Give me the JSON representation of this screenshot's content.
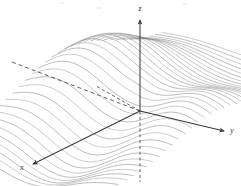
{
  "figure": {
    "title": "",
    "caption": "",
    "kind": "3d-surface-wireframe",
    "background_color": "#ffffff"
  },
  "axes": {
    "x": {
      "label": "x",
      "label_x": 22,
      "label_y": 170,
      "color": "#3a3a3a"
    },
    "y": {
      "label": "y",
      "label_x": 231,
      "label_y": 131,
      "color": "#3a3a3a"
    },
    "z": {
      "label": "z",
      "label_x": 140,
      "label_y": 9,
      "color": "#3a3a3a"
    }
  },
  "surface": {
    "mesh_color": "#8c8c8c",
    "mesh_color_dark": "#6e6e6e",
    "trace_count": 34,
    "style": "u-parameter traces"
  },
  "chart_data": {
    "type": "line",
    "title": "",
    "subtitle": "",
    "xlabel": "x",
    "ylabel": "y",
    "zlabel": "z",
    "projection": "3d-oblique",
    "origin_px": [
      140,
      111
    ],
    "grid": false,
    "legend": null,
    "axis_endpoints_px": {
      "x_negative": [
        12,
        62
      ],
      "x_positive": [
        32,
        165
      ],
      "y_negative": [
        96,
        86
      ],
      "y_positive": [
        226,
        131
      ],
      "z_positive": [
        140,
        18
      ],
      "z_negative": [
        140,
        182
      ]
    },
    "annotations": [
      {
        "text": "x",
        "x_px": 22,
        "y_px": 170
      },
      {
        "text": "y",
        "x_px": 231,
        "y_px": 131
      },
      {
        "text": "z",
        "x_px": 140,
        "y_px": 9
      }
    ],
    "surface_description": "A rippled saddle-like surface rendered as a family of parallel parametric traces; a tall crest on the left, a lower crest on the right, a valley running toward the viewer, drawn in light gray.",
    "traces": [
      {
        "name": "trace-01",
        "u": -1.0
      },
      {
        "name": "trace-02",
        "u": -0.94
      },
      {
        "name": "trace-03",
        "u": -0.88
      },
      {
        "name": "trace-04",
        "u": -0.82
      },
      {
        "name": "trace-05",
        "u": -0.76
      },
      {
        "name": "trace-06",
        "u": -0.7
      },
      {
        "name": "trace-07",
        "u": -0.64
      },
      {
        "name": "trace-08",
        "u": -0.58
      },
      {
        "name": "trace-09",
        "u": -0.52
      },
      {
        "name": "trace-10",
        "u": -0.46
      },
      {
        "name": "trace-11",
        "u": -0.4
      },
      {
        "name": "trace-12",
        "u": -0.34
      },
      {
        "name": "trace-13",
        "u": -0.28
      },
      {
        "name": "trace-14",
        "u": -0.22
      },
      {
        "name": "trace-15",
        "u": -0.16
      },
      {
        "name": "trace-16",
        "u": -0.1
      },
      {
        "name": "trace-17",
        "u": -0.04
      },
      {
        "name": "trace-18",
        "u": 0.02
      },
      {
        "name": "trace-19",
        "u": 0.08
      },
      {
        "name": "trace-20",
        "u": 0.14
      },
      {
        "name": "trace-21",
        "u": 0.2
      },
      {
        "name": "trace-22",
        "u": 0.26
      },
      {
        "name": "trace-23",
        "u": 0.32
      },
      {
        "name": "trace-24",
        "u": 0.38
      },
      {
        "name": "trace-25",
        "u": 0.44
      },
      {
        "name": "trace-26",
        "u": 0.5
      },
      {
        "name": "trace-27",
        "u": 0.56
      },
      {
        "name": "trace-28",
        "u": 0.62
      },
      {
        "name": "trace-29",
        "u": 0.68
      },
      {
        "name": "trace-30",
        "u": 0.74
      },
      {
        "name": "trace-31",
        "u": 0.8
      },
      {
        "name": "trace-32",
        "u": 0.86
      },
      {
        "name": "trace-33",
        "u": 0.92
      },
      {
        "name": "trace-34",
        "u": 1.0
      }
    ]
  }
}
